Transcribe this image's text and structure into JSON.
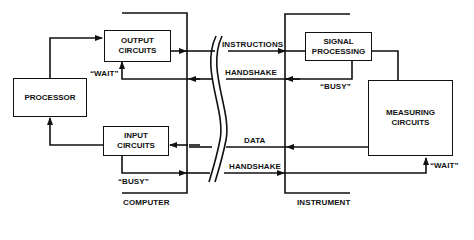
{
  "diagram": {
    "boxes": {
      "processor": "PROCESSOR",
      "output_circuits": "OUTPUT\nCIRCUITS",
      "input_circuits": "INPUT\nCIRCUITS",
      "signal_processing": "SIGNAL\nPROCESSING",
      "measuring_circuits": "MEASURING\nCIRCUITS"
    },
    "signals": {
      "instructions": "INSTRUCTIONS",
      "handshake_top": "HANDSHAKE",
      "data": "DATA",
      "handshake_bottom": "HANDSHAKE",
      "wait_computer": "“WAIT”",
      "busy_computer": "“BUSY”",
      "busy_instrument": "“BUSY”",
      "wait_instrument": "“WAIT”"
    },
    "groups": {
      "computer": "COMPUTER",
      "instrument": "INSTRUMENT"
    },
    "colors": {
      "line": "#111111",
      "background": "#ffffff"
    }
  }
}
